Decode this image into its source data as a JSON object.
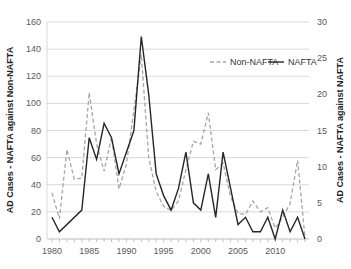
{
  "chart_data": {
    "type": "line",
    "title": "",
    "xlabel": "",
    "ylabel": "AD Cases - NAFTA against Non-NAFTA",
    "y2label": "AD Cases - NAFTA against NAFTA",
    "xlim": [
      1980,
      2014
    ],
    "ylim": [
      0,
      160
    ],
    "y2lim": [
      0,
      30
    ],
    "x_ticks": [
      1980,
      1985,
      1990,
      1995,
      2000,
      2005,
      2010
    ],
    "y_ticks": [
      0,
      20,
      40,
      60,
      80,
      100,
      120,
      140,
      160
    ],
    "y2_ticks": [
      0,
      5,
      10,
      15,
      20,
      25,
      30
    ],
    "grid": true,
    "legend_position": "top-right",
    "series": [
      {
        "name": "Non-NAFTA",
        "axis": "left",
        "style": "dashed",
        "color": "#a6a6a6",
        "x": [
          1980,
          1981,
          1982,
          1983,
          1984,
          1985,
          1986,
          1987,
          1988,
          1989,
          1990,
          1991,
          1992,
          1993,
          1994,
          1995,
          1996,
          1997,
          1998,
          1999,
          2000,
          2001,
          2002,
          2003,
          2004,
          2005,
          2006,
          2007,
          2008,
          2009,
          2010,
          2011,
          2012,
          2013,
          2014
        ],
        "values": [
          34,
          15,
          66,
          44,
          45,
          108,
          70,
          50,
          75,
          37,
          55,
          95,
          136,
          60,
          35,
          24,
          21,
          28,
          51,
          72,
          70,
          93,
          51,
          56,
          31,
          19,
          18,
          28,
          20,
          23,
          8,
          16,
          26,
          58,
          1
        ]
      },
      {
        "name": "NAFTA",
        "axis": "right",
        "style": "solid",
        "color": "#262626",
        "x": [
          1980,
          1981,
          1984,
          1985,
          1986,
          1987,
          1988,
          1989,
          1990,
          1991,
          1992,
          1993,
          1994,
          1995,
          1996,
          1997,
          1998,
          1999,
          2000,
          2001,
          2002,
          2003,
          2004,
          2005,
          2006,
          2007,
          2008,
          2009,
          2010,
          2011,
          2012,
          2013,
          2014
        ],
        "values": [
          3,
          1,
          4,
          14,
          11,
          16,
          14,
          9,
          12,
          15,
          28,
          20,
          9,
          6,
          4,
          7,
          12,
          5,
          4,
          9,
          3,
          12,
          7,
          2,
          3,
          1,
          1,
          3,
          0,
          4,
          1,
          3,
          0
        ]
      }
    ]
  }
}
